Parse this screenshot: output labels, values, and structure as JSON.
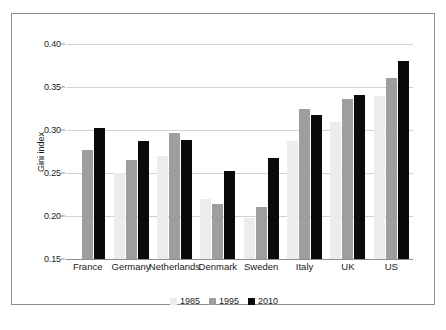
{
  "figure": {
    "y_axis_title": "Gini index",
    "caption": ""
  },
  "legend": {
    "items": [
      {
        "label": "1985",
        "color": "#ececec",
        "swatch": "legend-swatch-1985"
      },
      {
        "label": "1995",
        "color": "#9e9e9e",
        "swatch": "legend-swatch-1995"
      },
      {
        "label": "2010",
        "color": "#0a0a0a",
        "swatch": "legend-swatch-2010"
      }
    ]
  },
  "axis": {
    "y_ticks": [
      "0.40",
      "0.35",
      "0.30",
      "0.25",
      "0.20",
      "0.15"
    ],
    "y_tick_values": [
      0.4,
      0.35,
      0.3,
      0.25,
      0.2,
      0.15
    ]
  },
  "chart_data": {
    "type": "bar",
    "title": "",
    "subtitle": "",
    "xlabel": "",
    "ylabel": "Gini index",
    "ylim": [
      0.15,
      0.4
    ],
    "ytick_labels": [
      "0.15",
      "0.20",
      "0.25",
      "0.30",
      "0.35",
      "0.40"
    ],
    "grid": true,
    "legend_position": "bottom-center",
    "categories": [
      "France",
      "Germany",
      "Netherlands",
      "Denmark",
      "Sweden",
      "Italy",
      "UK",
      "US"
    ],
    "series": [
      {
        "name": "1985",
        "color": "#ececec",
        "values": [
          null,
          0.25,
          0.27,
          0.22,
          0.198,
          0.287,
          0.309,
          0.34
        ]
      },
      {
        "name": "1995",
        "color": "#9e9e9e",
        "values": [
          0.277,
          0.265,
          0.297,
          0.214,
          0.21,
          0.325,
          0.336,
          0.361
        ]
      },
      {
        "name": "2010",
        "color": "#0a0a0a",
        "values": [
          0.302,
          0.287,
          0.288,
          0.252,
          0.268,
          0.318,
          0.341,
          0.38
        ]
      }
    ]
  }
}
